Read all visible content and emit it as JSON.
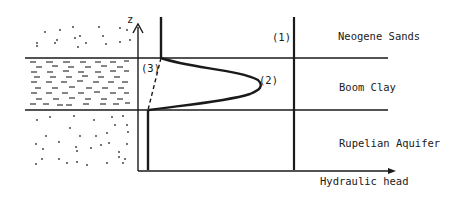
{
  "diagram": {
    "axes": {
      "y_label": "z",
      "x_label": "Hydraulic head"
    },
    "layers": [
      {
        "name": "Neogene Sands",
        "texture": "dots"
      },
      {
        "name": "Boom Clay",
        "texture": "dashes"
      },
      {
        "name": "Rupelian Aquifer",
        "texture": "dots"
      }
    ],
    "curves": [
      {
        "id": "1",
        "label": "(1)",
        "style": "solid-vertical"
      },
      {
        "id": "2",
        "label": "(2)",
        "style": "solid-bulge"
      },
      {
        "id": "3",
        "label": "(3)",
        "style": "dashed-linear"
      }
    ],
    "colors": {
      "ink": "#1a1a1a",
      "background": "#ffffff"
    }
  }
}
